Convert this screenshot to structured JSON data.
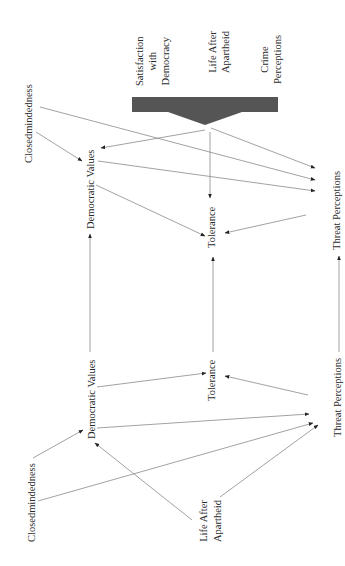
{
  "diagram": {
    "orientation": "rotated -90deg (text reads bottom-to-top)",
    "colors": {
      "background": "#ffffff",
      "line": "#8a8a8a",
      "arrowhead": "#222222",
      "block_arrow": "#555555",
      "text": "#2a2a2a"
    },
    "top_model": {
      "block_arrow_sources": {
        "satisfaction": "Satisfaction\nwith\nDemocracy",
        "life_after": "Life After\nApartheid",
        "crime": "Crime\nPerceptions"
      },
      "nodes": {
        "closedmindedness": "Closedmindedness",
        "democratic_values": "Democratic Values",
        "tolerance": "Tolerance",
        "threat_perceptions": "Threat Perceptions"
      },
      "edges": [
        {
          "from": "Closedmindedness",
          "to": "Democratic Values"
        },
        {
          "from": "Closedmindedness",
          "to": "Threat Perceptions"
        },
        {
          "from": "Block arrow (Satisfaction, Life After Apartheid, Crime Perceptions)",
          "to": "Democratic Values"
        },
        {
          "from": "Block arrow (Satisfaction, Life After Apartheid, Crime Perceptions)",
          "to": "Tolerance"
        },
        {
          "from": "Block arrow (Satisfaction, Life After Apartheid, Crime Perceptions)",
          "to": "Threat Perceptions"
        },
        {
          "from": "Democratic Values",
          "to": "Threat Perceptions"
        },
        {
          "from": "Democratic Values",
          "to": "Tolerance"
        },
        {
          "from": "Threat Perceptions",
          "to": "Tolerance"
        }
      ]
    },
    "bottom_model": {
      "nodes": {
        "closedmindedness": "Closedmindedness",
        "democratic_values": "Democratic Values",
        "tolerance": "Tolerance",
        "threat_perceptions": "Threat Perceptions",
        "life_after": "Life After\nApartheid"
      },
      "edges": [
        {
          "from": "Closedmindedness",
          "to": "Democratic Values"
        },
        {
          "from": "Closedmindedness",
          "to": "Threat Perceptions"
        },
        {
          "from": "Life After Apartheid",
          "to": "Democratic Values"
        },
        {
          "from": "Life After Apartheid",
          "to": "Threat Perceptions"
        },
        {
          "from": "Democratic Values",
          "to": "Tolerance"
        },
        {
          "from": "Democratic Values",
          "to": "Threat Perceptions"
        },
        {
          "from": "Threat Perceptions",
          "to": "Tolerance"
        }
      ]
    },
    "cross_links": [
      {
        "from": "Democratic Values (bottom)",
        "to": "Democratic Values (top)"
      },
      {
        "from": "Tolerance (bottom)",
        "to": "Tolerance (top)"
      },
      {
        "from": "Threat Perceptions (bottom)",
        "to": "Threat Perceptions (top)"
      }
    ]
  }
}
